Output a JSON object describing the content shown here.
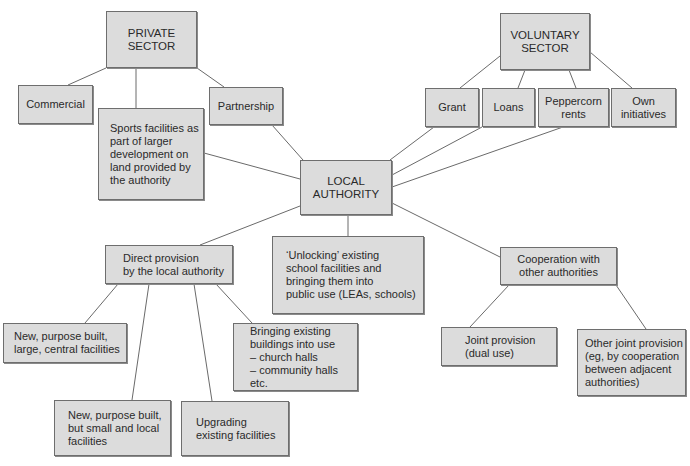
{
  "diagram": {
    "nodes": {
      "private_sector": "PRIVATE\nSECTOR",
      "commercial": "Commercial",
      "sports_facilities": "Sports facilities as\npart of larger\ndevelopment on\nland provided by\nthe authority",
      "partnership": "Partnership",
      "voluntary_sector": "VOLUNTARY\nSECTOR",
      "grant": "Grant",
      "loans": "Loans",
      "peppercorn_rents": "Peppercorn\nrents",
      "own_initiatives": "Own\ninitiatives",
      "local_authority": "LOCAL\nAUTHORITY",
      "direct_provision": "Direct provision\nby the local authority",
      "unlocking": "‘Unlocking’ existing\nschool facilities and\nbringing them into\npublic use (LEAs, schools)",
      "cooperation": "Cooperation with\nother authorities",
      "new_large": "New, purpose built,\nlarge, central facilities",
      "bringing_existing": "Bringing existing\nbuildings into use\n– church halls\n– community halls etc.",
      "new_small": "New, purpose built,\nbut small and local\nfacilities",
      "upgrading": "Upgrading\nexisting facilities",
      "joint_provision": "Joint provision\n(dual use)",
      "other_joint": "Other joint provision\n(eg, by cooperation\nbetween adjacent\nauthorities)"
    },
    "edges": [
      [
        "private_sector",
        "commercial"
      ],
      [
        "private_sector",
        "sports_facilities"
      ],
      [
        "private_sector",
        "partnership"
      ],
      [
        "sports_facilities",
        "local_authority"
      ],
      [
        "partnership",
        "local_authority"
      ],
      [
        "voluntary_sector",
        "grant"
      ],
      [
        "voluntary_sector",
        "loans"
      ],
      [
        "voluntary_sector",
        "peppercorn_rents"
      ],
      [
        "voluntary_sector",
        "own_initiatives"
      ],
      [
        "grant",
        "local_authority"
      ],
      [
        "loans",
        "local_authority"
      ],
      [
        "peppercorn_rents",
        "local_authority"
      ],
      [
        "local_authority",
        "direct_provision"
      ],
      [
        "local_authority",
        "unlocking"
      ],
      [
        "local_authority",
        "cooperation"
      ],
      [
        "direct_provision",
        "new_large"
      ],
      [
        "direct_provision",
        "new_small"
      ],
      [
        "direct_provision",
        "upgrading"
      ],
      [
        "direct_provision",
        "bringing_existing"
      ],
      [
        "cooperation",
        "joint_provision"
      ],
      [
        "cooperation",
        "other_joint"
      ]
    ],
    "colors": {
      "box_fill": "#dcdcdc",
      "box_border": "#6e6e6e",
      "connector": "#6a6a6a",
      "text": "#2a2a2a"
    }
  }
}
